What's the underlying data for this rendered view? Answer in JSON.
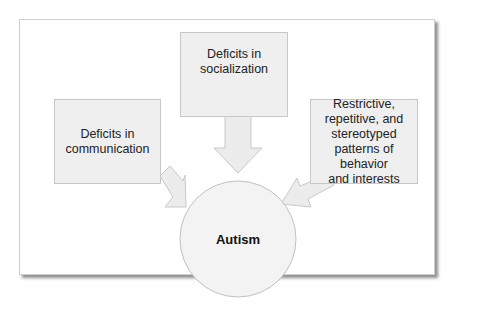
{
  "diagram": {
    "center": {
      "label": "Autism"
    },
    "nodes": [
      {
        "id": "communication",
        "label": "Deficits in communication",
        "lines": [
          "Deficits in",
          "communication"
        ]
      },
      {
        "id": "socialization",
        "label": "Deficits in socialization",
        "lines": [
          "Deficits in",
          "socialization"
        ]
      },
      {
        "id": "behavior",
        "label": "Restrictive, repetitive, and stereotyped patterns of behavior and interests",
        "lines": [
          "Restrictive,",
          "repetitive, and",
          "stereotyped",
          "patterns of behavior",
          "and interests"
        ]
      }
    ],
    "edges": [
      {
        "from": "communication",
        "to": "autism"
      },
      {
        "from": "socialization",
        "to": "autism"
      },
      {
        "from": "behavior",
        "to": "autism"
      }
    ],
    "colors": {
      "box_fill": "#efefef",
      "box_border": "#c8c8c8",
      "arrow_fill": "#ececec",
      "circle_fill": "#f3f3f3"
    }
  }
}
